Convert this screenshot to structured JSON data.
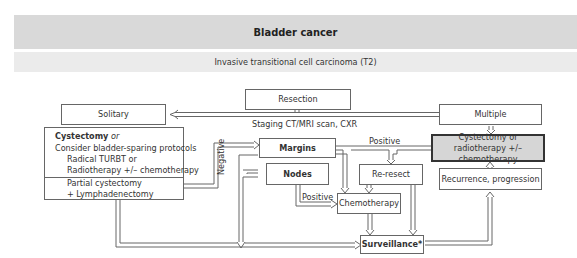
{
  "header": {
    "title": "Bladder cancer",
    "subtitle": "Invasive transitional cell carcinoma (T2)"
  },
  "nodes": {
    "resection": "Resection",
    "staging": "Staging CT/MRI scan, CXR",
    "solitary": "Solitary",
    "multiple": "Multiple",
    "left_box": {
      "line1": "Cystectomy",
      "line1_suffix": " or",
      "line2": "Consider bladder-sparing protocols",
      "line3": "Radical TURBT or",
      "line4": "Radiotherapy +/– chemotherapy",
      "line5": "Partial cystectomy",
      "line6": "+ Lymphadenectomy"
    },
    "margins": "Margins",
    "nodes_box": "Nodes",
    "reresect": "Re-resect",
    "chemotherapy": "Chemotherapy",
    "surveillance": "Surveillance*",
    "cystectomy_radio_line1": "Cystectomy or",
    "cystectomy_radio_line2": "radiotherapy +/– chemotherapy",
    "recurrence": "Recurrence, progression"
  },
  "edge_labels": {
    "negative": "Negative",
    "positive_margins": "Positive",
    "positive_nodes": "Positive"
  }
}
